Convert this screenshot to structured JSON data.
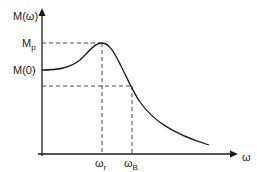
{
  "diagram": {
    "y_axis_label": "M(ω)",
    "x_axis_label": "ω",
    "labels": {
      "peak": {
        "main": "M",
        "sub": "p"
      },
      "dc_gain": "M(0)",
      "resonant_freq": {
        "main": "ω",
        "sub": "r"
      },
      "bandwidth_freq": {
        "main": "ω",
        "sub": "B"
      }
    },
    "colors": {
      "line": "#1a1a1a",
      "dashed": "#333333",
      "background": "#ffffff"
    }
  }
}
